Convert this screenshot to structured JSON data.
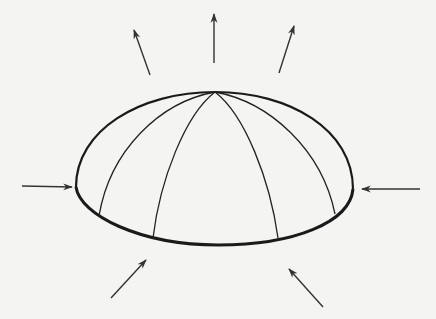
{
  "diagram": {
    "title": "Dome under radial forces",
    "colors": {
      "background": "#f4f4f2",
      "stroke": "#1a1a1a",
      "arrow": "#333333"
    },
    "dome": {
      "apex": [
        215,
        92
      ],
      "left_edge": [
        76,
        187
      ],
      "right_edge": [
        353,
        189
      ],
      "base_bottom": [
        218,
        245
      ],
      "meridian_count": 4
    },
    "arrows": [
      {
        "id": "top-left-outward",
        "direction": "outward",
        "from": [
          150,
          75
        ],
        "to": [
          134,
          30
        ]
      },
      {
        "id": "top-center-outward",
        "direction": "outward",
        "from": [
          214,
          63
        ],
        "to": [
          214,
          14
        ]
      },
      {
        "id": "top-right-outward",
        "direction": "outward",
        "from": [
          279,
          73
        ],
        "to": [
          294,
          26
        ]
      },
      {
        "id": "left-inward",
        "direction": "inward",
        "from": [
          22,
          186
        ],
        "to": [
          72,
          187
        ]
      },
      {
        "id": "right-inward",
        "direction": "inward",
        "from": [
          420,
          189
        ],
        "to": [
          362,
          189
        ]
      },
      {
        "id": "bottom-left-inward",
        "direction": "inward",
        "from": [
          111,
          298
        ],
        "to": [
          146,
          260
        ]
      },
      {
        "id": "bottom-right-inward",
        "direction": "inward",
        "from": [
          323,
          307
        ],
        "to": [
          289,
          269
        ]
      }
    ]
  }
}
